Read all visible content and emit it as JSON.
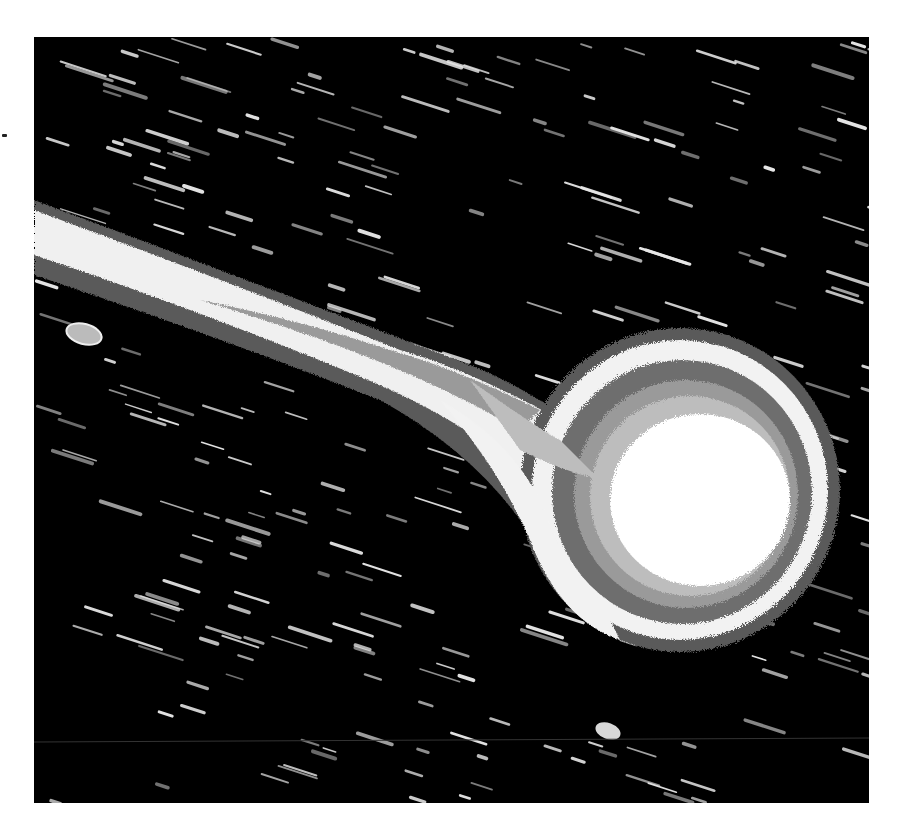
{
  "image": {
    "subject": "comet with tail against star-trailed background",
    "style": "grayscale isophote contour rendering",
    "frame": {
      "x": 34,
      "y": 37,
      "width": 835,
      "height": 766
    },
    "colors": {
      "background": "#000000",
      "page": "#ffffff",
      "contour_outer": "#5a5a5a",
      "contour_bright_ring": "#f2f2f2",
      "contour_mid": "#7d7d7d",
      "contour_inner": "#bdbdbd",
      "nucleus": "#ffffff",
      "star_trail": "#e6e6e6"
    },
    "nucleus": {
      "cx": 700,
      "cy": 497,
      "r": 90
    },
    "coma_outer": {
      "cx": 685,
      "cy": 490,
      "rx": 150,
      "ry": 150
    },
    "tail_direction": "upper-left",
    "star_trail_angle_deg": 18
  }
}
